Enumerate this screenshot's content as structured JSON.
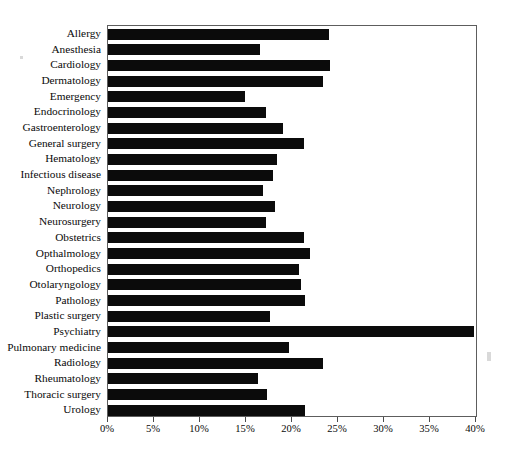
{
  "chart_data": {
    "type": "bar",
    "orientation": "horizontal",
    "title": "",
    "subtitle": "",
    "xlabel": "",
    "ylabel": "",
    "xlim": [
      0,
      40
    ],
    "xunit": "%",
    "grid": false,
    "legend": null,
    "bar_color": "#0b0b0b",
    "frame_color": "#5d5d5d",
    "xticks": [
      0,
      5,
      10,
      15,
      20,
      25,
      30,
      35,
      40
    ],
    "xtick_labels": [
      "0%",
      "5%",
      "10%",
      "15%",
      "20%",
      "25%",
      "30%",
      "35%",
      "40%"
    ],
    "categories": [
      "Allergy",
      "Anesthesia",
      "Cardiology",
      "Dermatology",
      "Emergency",
      "Endocrinology",
      "Gastroenterology",
      "General surgery",
      "Hematology",
      "Infectious disease",
      "Nephrology",
      "Neurology",
      "Neurosurgery",
      "Obstetrics",
      "Opthalmology",
      "Orthopedics",
      "Otolaryngology",
      "Pathology",
      "Plastic surgery",
      "Psychiatry",
      "Pulmonary medicine",
      "Radiology",
      "Rheumatology",
      "Thoracic surgery",
      "Urology"
    ],
    "values": [
      24.0,
      16.5,
      24.1,
      23.4,
      14.9,
      17.2,
      19.0,
      21.3,
      18.4,
      17.9,
      16.8,
      18.2,
      17.2,
      21.3,
      22.0,
      20.8,
      21.0,
      21.4,
      17.6,
      39.8,
      19.7,
      23.4,
      16.3,
      17.3,
      21.4
    ]
  }
}
